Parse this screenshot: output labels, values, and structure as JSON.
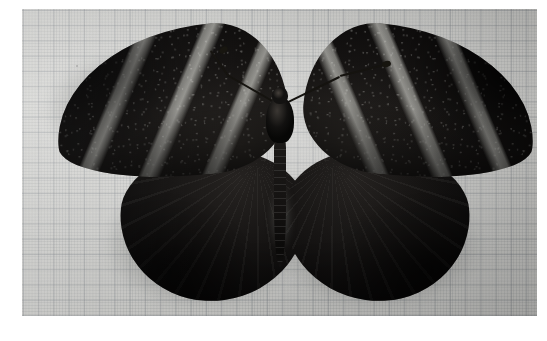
{
  "image": {
    "kind": "natural-photograph",
    "subject": "butterfly-specimen",
    "subject_description": "Pinned dark butterfly specimen with wings spread, photographed from above",
    "background_description": "Light gray graph paper with fine square grid",
    "orientation": "dorsal view, wings fully spread",
    "border": {
      "color": "#ffffff",
      "left_px": 22,
      "top_px": 9,
      "right_px": 10,
      "bottom_px": 25
    },
    "photo": {
      "width_px": 515,
      "height_px": 307,
      "paper_color": "#d2d2cf",
      "grid_minor_px": 3,
      "grid_major_px": 15,
      "grid_line_color": "#6a7078"
    },
    "colors": {
      "wing_dark": "#0b0a09",
      "wing_midtone": "#262321",
      "band_pale": "#c0c0ba",
      "body_dark": "#131211",
      "paper": "#d2d2cf",
      "border": "#ffffff",
      "shadow": "#2a2c2a"
    },
    "specimen_parts": [
      {
        "name": "left-forewing",
        "description": "Elongated dark forewing with three pale diagonal bands, apex toward upper left",
        "band_count": 3
      },
      {
        "name": "right-forewing",
        "description": "Mirror of left forewing, apex toward upper right",
        "band_count": 3
      },
      {
        "name": "left-hindwing",
        "description": "Rounded uniformly dark hindwing with faint radiating veins"
      },
      {
        "name": "right-hindwing",
        "description": "Mirror of left hindwing, rounded and uniformly dark"
      },
      {
        "name": "thorax",
        "description": "Dark furry thorax at wing junction"
      },
      {
        "name": "head",
        "description": "Small dark head with palpi"
      },
      {
        "name": "abdomen",
        "description": "Long segmented dark abdomen extending downward between hindwings"
      },
      {
        "name": "left-antenna",
        "description": "Thin antenna curving up and to the left with a clubbed tip"
      },
      {
        "name": "right-antenna",
        "description": "Thin antenna lying along the leading edge of the right forewing"
      }
    ]
  }
}
